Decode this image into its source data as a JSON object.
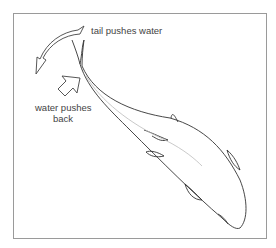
{
  "diagram": {
    "type": "fish-propulsion",
    "labels": {
      "tail_pushes": "tail pushes water",
      "water_pushes_line1": "water pushes",
      "water_pushes_line2": "back"
    },
    "colors": {
      "outline": "#333333",
      "lateral_line": "#b8b8b8",
      "frame": "#9a9a9a",
      "text": "#444444"
    }
  }
}
